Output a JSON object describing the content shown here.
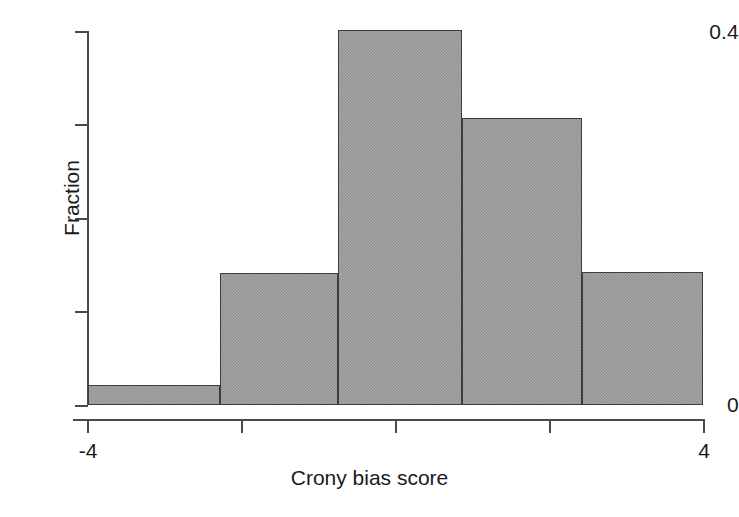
{
  "chart_data": {
    "type": "bar",
    "title": "",
    "subtitle": "",
    "xlabel": "Crony bias score",
    "ylabel": "Fraction",
    "xlim": [
      -4,
      4
    ],
    "ylim": [
      0,
      0.41
    ],
    "grid": false,
    "legend": null,
    "xtick_labels": [
      "-4",
      "",
      "",
      "",
      "4"
    ],
    "xtick_values": [
      -4,
      -2,
      0,
      2,
      4
    ],
    "ytick_labels": [
      "0.4",
      "",
      "",
      "",
      "0"
    ],
    "ytick_values": [
      0.4,
      0.3,
      0.2,
      0.1,
      0
    ],
    "bin_edges": [
      -4.0,
      -2.28,
      -0.75,
      0.86,
      2.43,
      4.0
    ],
    "categories": [
      "-4.0 to -2.28",
      "-2.28 to -0.75",
      "-0.75 to 0.86",
      "0.86 to 2.43",
      "2.43 to 4.0"
    ],
    "values": [
      0.021,
      0.141,
      0.401,
      0.307,
      0.142
    ],
    "bar_fill_color": "#a6a6a6",
    "bar_edge_color": "#3d3d3d",
    "axis_color": "#4a4a4a",
    "background_color": "#ffffff"
  },
  "axes": {
    "y_ticks": [
      {
        "label": "0.4",
        "value": 0.4
      },
      {
        "label": "",
        "value": 0.3
      },
      {
        "label": "",
        "value": 0.2
      },
      {
        "label": "",
        "value": 0.1
      },
      {
        "label": "0",
        "value": 0
      }
    ],
    "x_ticks": [
      {
        "label": "-4",
        "value": -4
      },
      {
        "label": "",
        "value": -2
      },
      {
        "label": "",
        "value": 0
      },
      {
        "label": "",
        "value": 2
      },
      {
        "label": "4",
        "value": 4
      }
    ]
  }
}
